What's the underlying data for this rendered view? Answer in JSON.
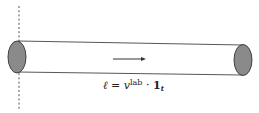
{
  "diagram": {
    "label": {
      "ell": "ℓ",
      "equals": " = ",
      "v": "v",
      "v_sup": "lab",
      "dot": " · ",
      "one": "1",
      "one_sub": "t"
    },
    "colors": {
      "cap_fill": "#8a8a8a",
      "stroke": "#333333",
      "background": "#ffffff"
    }
  }
}
